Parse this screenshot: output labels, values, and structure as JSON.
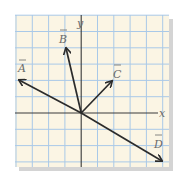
{
  "diagram": {
    "type": "vector-diagram",
    "axes": {
      "x_label": "x",
      "y_label": "y"
    },
    "grid": {
      "columns": 9,
      "rows": 9,
      "origin_col": 4,
      "origin_row": 6,
      "background": "#fbf5e4",
      "line_color": "#a9c9e8"
    },
    "vectors": [
      {
        "name": "A",
        "label": "A",
        "components": [
          -4,
          2
        ]
      },
      {
        "name": "B",
        "label": "B",
        "components": [
          -1,
          4
        ]
      },
      {
        "name": "C",
        "label": "C",
        "components": [
          2,
          2
        ]
      },
      {
        "name": "D",
        "label": "D",
        "components": [
          5,
          -3
        ]
      }
    ],
    "colors": {
      "vector": "#2b2b2b",
      "axis": "#3a3a3a",
      "shadow": "#d4d4d4"
    }
  }
}
